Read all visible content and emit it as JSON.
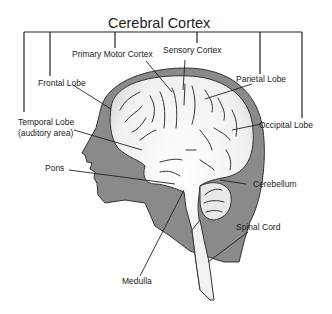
{
  "title": "Cerebral Cortex",
  "labels": {
    "primary_motor_cortex": "Primary Motor Cortex",
    "sensory_cortex": "Sensory Cortex",
    "frontal_lobe": "Frontal Lobe",
    "parietal_lobe": "Parietal Lobe",
    "temporal_lobe_1": "Temporal Lobe",
    "temporal_lobe_2": "(auditory area)",
    "occipital_lobe": "Occipital Lobe",
    "pons": "Pons",
    "cerebellum": "Cerebellum",
    "spinal_cord": "Spinal Cord",
    "medulla": "Medulla"
  },
  "colors": {
    "head": "#8a8a8a",
    "brain": "#f4f4f4",
    "outline": "#222222",
    "background": "#ffffff"
  }
}
